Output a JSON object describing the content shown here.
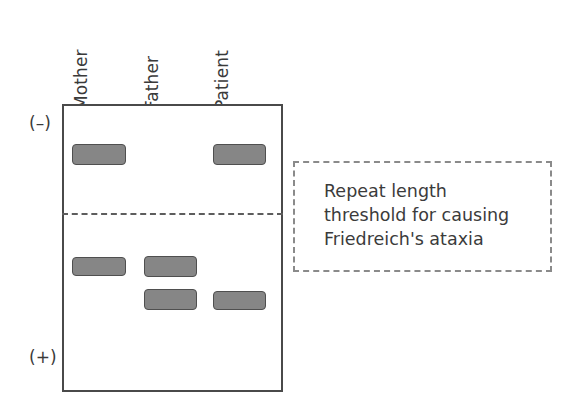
{
  "figure": {
    "type": "gel-electrophoresis-diagram",
    "background_color": "#ffffff",
    "band_fill_color": "#868686",
    "band_border_color": "#4f4f4f",
    "gel_border_color": "#4a4a4a",
    "threshold_line_color": "#5d5d5d",
    "callout_border_color": "#8a8a8a",
    "text_color": "#3b3b3b"
  },
  "lanes": [
    {
      "id": "mother",
      "label": "Mother",
      "center_x": 99
    },
    {
      "id": "father",
      "label": "Father",
      "center_x": 170
    },
    {
      "id": "patient",
      "label": "Patient",
      "center_x": 240
    }
  ],
  "polarity": {
    "negative_label": "(–)",
    "positive_label": "(+)"
  },
  "gel": {
    "left": 62,
    "top": 104,
    "width": 221,
    "height": 288
  },
  "threshold": {
    "y": 213,
    "style": "dashed",
    "spans_gel_width": true
  },
  "bands": [
    {
      "lane": "mother",
      "position": "above-threshold",
      "x": 72,
      "y": 144,
      "w": 54,
      "h": 21
    },
    {
      "lane": "patient",
      "position": "above-threshold",
      "x": 213,
      "y": 144,
      "w": 53,
      "h": 21
    },
    {
      "lane": "mother",
      "position": "below-threshold",
      "x": 72,
      "y": 257,
      "w": 54,
      "h": 19
    },
    {
      "lane": "father",
      "position": "below-threshold",
      "x": 144,
      "y": 256,
      "w": 53,
      "h": 21
    },
    {
      "lane": "father",
      "position": "below-threshold",
      "x": 144,
      "y": 289,
      "w": 53,
      "h": 21
    },
    {
      "lane": "patient",
      "position": "below-threshold",
      "x": 213,
      "y": 291,
      "w": 53,
      "h": 19
    }
  ],
  "callout": {
    "text": "Repeat length\nthreshold for causing\nFriedreich's ataxia",
    "line1": "Repeat length",
    "line2": "threshold for causing",
    "line3": "Friedreich's ataxia"
  }
}
